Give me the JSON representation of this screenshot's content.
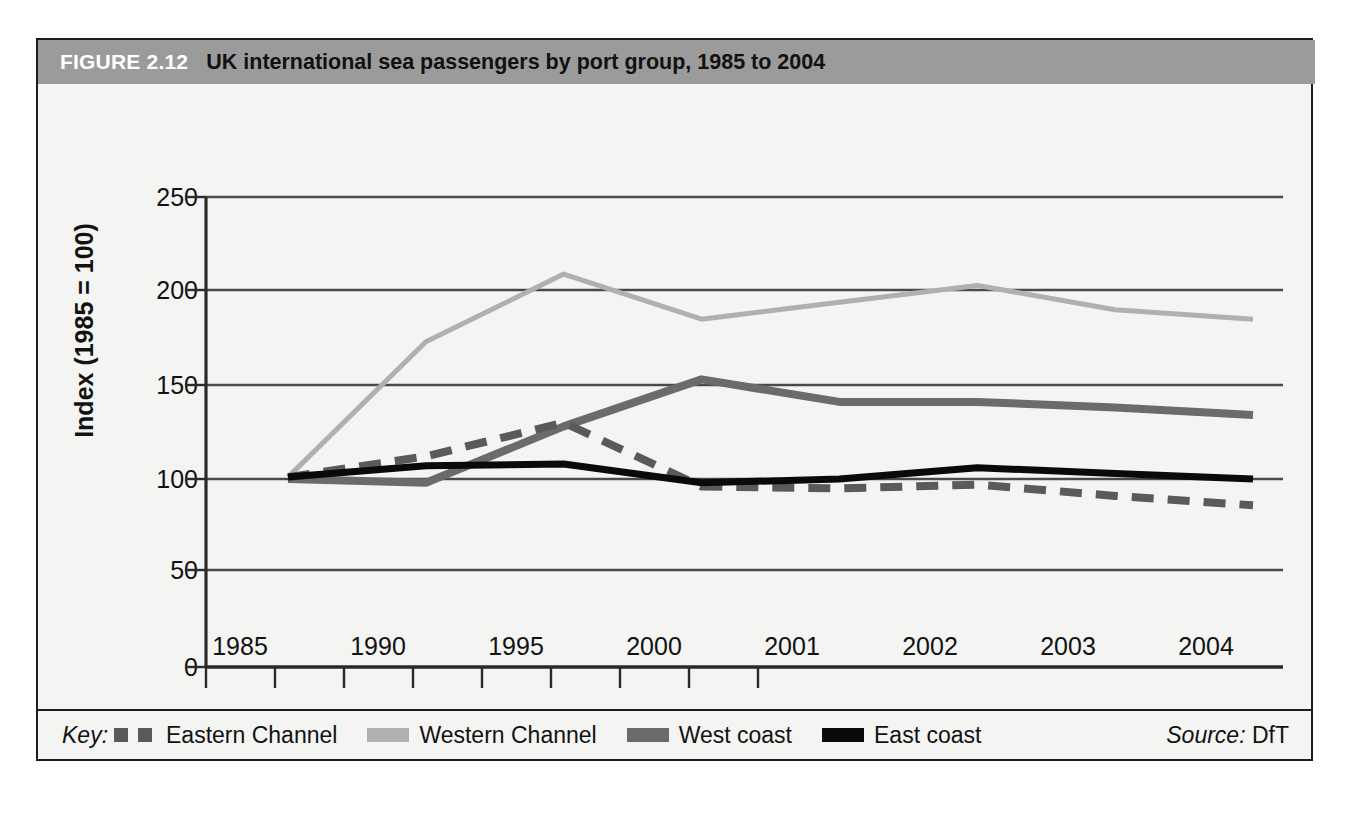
{
  "figure": {
    "number_label": "FIGURE 2.12",
    "title": "UK international sea passengers by port group, 1985 to 2004"
  },
  "legend": {
    "key_label": "Key:",
    "entries": [
      {
        "label": "Eastern Channel",
        "style": "dashed",
        "color": "#5a5a5a"
      },
      {
        "label": "Western Channel",
        "style": "thin-solid",
        "color": "#b0b0b0"
      },
      {
        "label": "West coast",
        "style": "thick-solid",
        "color": "#6b6b6b"
      },
      {
        "label": "East coast",
        "style": "thick-solid",
        "color": "#0a0a0a"
      }
    ],
    "source_word": "Source:",
    "source_value": "DfT"
  },
  "chart_data": {
    "type": "line",
    "title": "UK international sea passengers by port group, 1985 to 2004",
    "xlabel": "",
    "ylabel": "Index (1985 = 100)",
    "categories": [
      "1985",
      "1990",
      "1995",
      "2000",
      "2001",
      "2002",
      "2003",
      "2004"
    ],
    "ylim": [
      0,
      250
    ],
    "yticks": [
      0,
      50,
      100,
      150,
      200,
      250
    ],
    "grid": "horizontal",
    "legend_position": "bottom",
    "series": [
      {
        "name": "Eastern Channel",
        "color": "#5a5a5a",
        "style": "dashed",
        "values": [
          101,
          112,
          130,
          96,
          95,
          97,
          91,
          86
        ]
      },
      {
        "name": "Western Channel",
        "color": "#b0b0b0",
        "style": "thin-solid",
        "values": [
          101,
          173,
          209,
          185,
          194,
          203,
          190,
          185
        ]
      },
      {
        "name": "West coast",
        "color": "#6b6b6b",
        "style": "thick-solid",
        "values": [
          100,
          98,
          128,
          153,
          141,
          141,
          138,
          134
        ]
      },
      {
        "name": "East coast",
        "color": "#0a0a0a",
        "style": "thick-solid",
        "values": [
          101,
          107,
          108,
          98,
          100,
          106,
          103,
          100
        ]
      }
    ]
  },
  "axes": {
    "y_tick_labels": [
      "250",
      "200",
      "150",
      "100",
      "50",
      "0"
    ],
    "x_tick_labels": [
      "1985",
      "1990",
      "1995",
      "2000",
      "2001",
      "2002",
      "2003",
      "2004"
    ]
  }
}
